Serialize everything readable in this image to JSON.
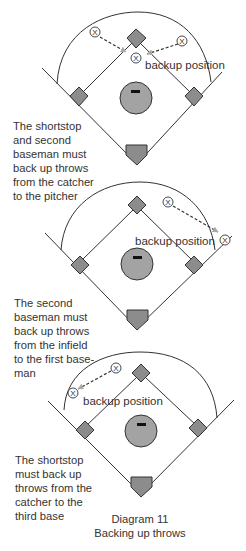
{
  "diagrams": [
    {
      "label": "backup position",
      "description": "The shortstop\nand second\nbaseman must\nback up throws\nfrom the catcher\nto the pitcher",
      "players": [
        {
          "symbol": "X",
          "role": "shortstop"
        },
        {
          "symbol": "X",
          "role": "second baseman"
        },
        {
          "symbol": "X",
          "role": "backup"
        }
      ]
    },
    {
      "label": "backup position",
      "description": "The second\nbaseman must\nback up throws\nfrom the infield\nto the first base-\nman",
      "players": [
        {
          "symbol": "X",
          "role": "second baseman"
        },
        {
          "symbol": "X",
          "role": "backup"
        }
      ]
    },
    {
      "label": "backup position",
      "description": "The shortstop\nmust back up\nthrows from the\ncatcher to the\nthird base",
      "players": [
        {
          "symbol": "X",
          "role": "shortstop"
        },
        {
          "symbol": "X",
          "role": "backup"
        }
      ]
    }
  ],
  "caption": {
    "number": "Diagram 11",
    "title": "Backing up throws"
  },
  "colors": {
    "line": "#333333",
    "base_fill": "#8c8c8c",
    "mound_fill": "#a3a3a3",
    "arrow_head": "#a8a8a8",
    "text": "#333333",
    "background": "#ffffff"
  }
}
